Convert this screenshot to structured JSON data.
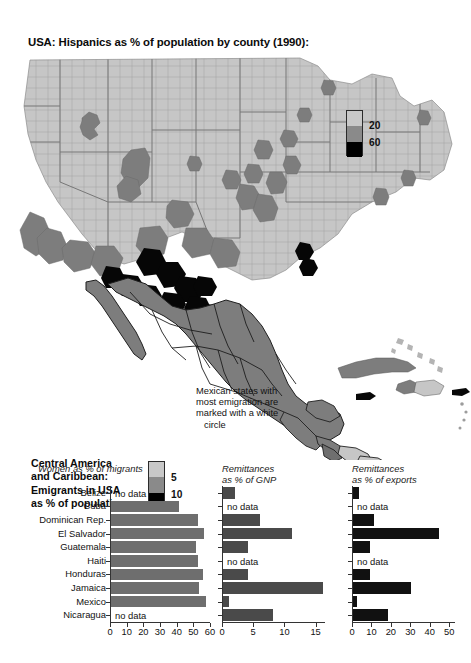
{
  "map": {
    "title": "USA: Hispanics as % of population by county (1990):",
    "usa_legend": {
      "name": "usa-hispanics-legend",
      "label_mid": "20",
      "label_high": "60",
      "colors": [
        "#c8c8c8",
        "#8a8a8a",
        "#000000"
      ]
    },
    "caribbean_legend": {
      "label_mid": "5",
      "label_high": "10",
      "colors": [
        "#c8c8c8",
        "#8a8a8a",
        "#000000"
      ]
    },
    "caribbean_title": [
      "Central America",
      "and Caribbean:",
      "Emigrants in USA",
      "as % of population"
    ],
    "annotation": [
      "Mexican states with",
      "most emigration are",
      "marked with a white",
      "circle"
    ]
  },
  "chart_data": [
    {
      "type": "bar",
      "orientation": "horizontal",
      "title": "Women as % of migrants",
      "title_lines": [
        "Women as % of migrants"
      ],
      "categories": [
        "Belize",
        "Cuba",
        "Dominican Rep.",
        "El Salvador",
        "Guatemala",
        "Haiti",
        "Honduras",
        "Jamaica",
        "Mexico",
        "Nicaragua"
      ],
      "values": [
        null,
        41,
        52,
        56,
        51,
        52,
        55,
        53,
        57,
        null
      ],
      "no_data_label": "no data",
      "xlabel": "",
      "ylabel": "",
      "xlim": [
        0,
        60
      ],
      "xticks": [
        0,
        10,
        20,
        30,
        40,
        50,
        60
      ],
      "bar_color": "#6e6e6e",
      "grid": false,
      "show_category_labels": true
    },
    {
      "type": "bar",
      "orientation": "horizontal",
      "title": "Remittances as % of GNP",
      "title_lines": [
        "Remittances",
        "as % of GNP"
      ],
      "categories": [
        "Belize",
        "Cuba",
        "Dominican Rep.",
        "El Salvador",
        "Guatemala",
        "Haiti",
        "Honduras",
        "Jamaica",
        "Mexico",
        "Nicaragua"
      ],
      "values": [
        2,
        null,
        6,
        11,
        4,
        null,
        4,
        16,
        1,
        8
      ],
      "no_data_label": "no data",
      "xlabel": "",
      "ylabel": "",
      "xlim": [
        0,
        16.5
      ],
      "xticks": [
        0,
        5,
        10,
        15
      ],
      "bar_color": "#4a4a4a",
      "grid": false,
      "show_category_labels": false
    },
    {
      "type": "bar",
      "orientation": "horizontal",
      "title": "Remittances as % of exports",
      "title_lines": [
        "Remittances",
        "as % of exports"
      ],
      "categories": [
        "Belize",
        "Cuba",
        "Dominican Rep.",
        "El Salvador",
        "Guatemala",
        "Haiti",
        "Honduras",
        "Jamaica",
        "Mexico",
        "Nicaragua"
      ],
      "values": [
        3,
        null,
        11,
        44,
        9,
        null,
        9,
        30,
        2,
        18
      ],
      "no_data_label": "no data",
      "xlabel": "",
      "ylabel": "",
      "xlim": [
        0,
        53
      ],
      "xticks": [
        0,
        10,
        20,
        30,
        40,
        50
      ],
      "bar_color": "#111111",
      "grid": false,
      "show_category_labels": false
    }
  ]
}
